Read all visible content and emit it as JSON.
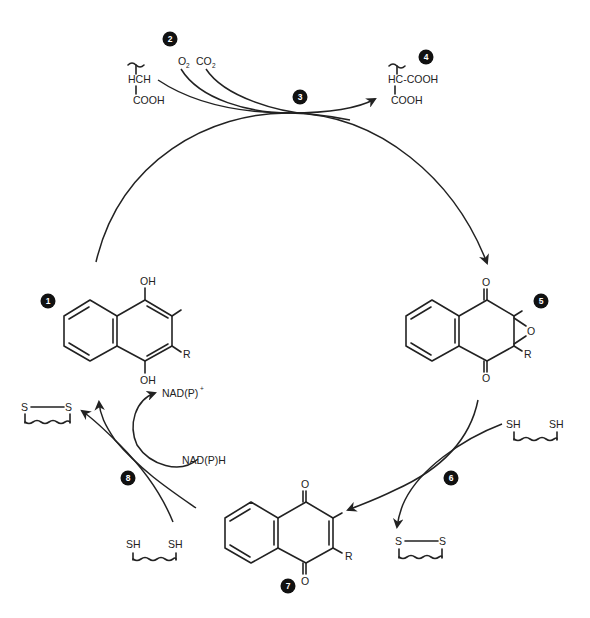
{
  "figure": {
    "type": "reaction-cycle"
  },
  "badges": {
    "b1": "1",
    "b2": "2",
    "b3": "3",
    "b4": "4",
    "b5": "5",
    "b6": "6",
    "b7": "7",
    "b8": "8"
  },
  "substrate": {
    "top": "HCH",
    "bottom": "COOH"
  },
  "gases": {
    "o2": "O",
    "o2_sub": "2",
    "co2": "CO",
    "co2_sub": "2"
  },
  "product": {
    "top": "HC-COOH",
    "bottom": "COOH"
  },
  "hydroquinone": {
    "oh_top": "OH",
    "oh_bottom": "OH",
    "r": "R"
  },
  "epoxide": {
    "o_top": "O",
    "o_bottom": "O",
    "o_ring": "O",
    "r": "R"
  },
  "quinone": {
    "o_top": "O",
    "o_bottom": "O",
    "r": "R"
  },
  "dithiol_right": {
    "sh1": "SH",
    "sh2": "SH"
  },
  "disulfide_right": {
    "s1": "S",
    "s2": "S"
  },
  "dithiol_left": {
    "sh1": "SH",
    "sh2": "SH"
  },
  "disulfide_left": {
    "s1": "S",
    "s2": "S"
  },
  "cofactors": {
    "nadp_plus": "NAD(P)",
    "nadp_plus_sup": "+",
    "nadph": "NAD(P)H"
  }
}
